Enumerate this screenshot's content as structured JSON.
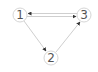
{
  "diagram": {
    "type": "directed-graph",
    "nodes": [
      {
        "id": "1",
        "label": "1",
        "x": 20,
        "y": 15
      },
      {
        "id": "2",
        "label": "2",
        "x": 51,
        "y": 58
      },
      {
        "id": "3",
        "label": "3",
        "x": 84,
        "y": 15
      }
    ],
    "edges": [
      {
        "from": "1",
        "to": "3"
      },
      {
        "from": "3",
        "to": "1"
      },
      {
        "from": "1",
        "to": "2"
      },
      {
        "from": "2",
        "to": "3"
      }
    ],
    "colors": {
      "node_stroke": "#d6d6d6",
      "edge": "#cfcfcf",
      "arrowhead": "#333333",
      "label": "#555555"
    }
  }
}
